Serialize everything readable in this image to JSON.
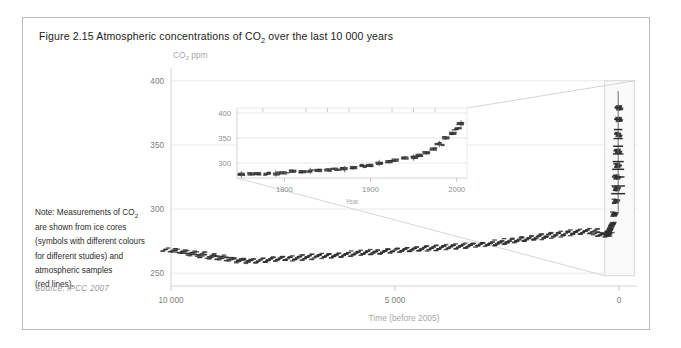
{
  "figure": {
    "title_prefix": "Figure 2.15 Atmospheric concentrations of CO",
    "title_sub": "2",
    "title_suffix": " over the last 10 000 years",
    "note_line1_a": "Note: Measurements of CO",
    "note_line1_sub": "2",
    "note_line2": "are shown from ice cores",
    "note_line3": "(symbols with different colours",
    "note_line4": "for different studies) and",
    "note_line5": "atmospheric samples",
    "note_line6": "(red lines).",
    "source": "Source: IPCC 2007",
    "border_color": "#b9b9b9"
  },
  "chart_data": {
    "type": "scatter",
    "title": "Figure 2.15 Atmospheric concentrations of CO2 over the last 10 000 years",
    "xlabel": "Time (before 2005)",
    "ylabel": "CO2 ppm",
    "xlim": [
      10000,
      -400
    ],
    "ylim": [
      240,
      410
    ],
    "x_ticks": [
      10000,
      5000,
      0
    ],
    "x_tick_labels": [
      "10 000",
      "5 000",
      "0"
    ],
    "y_ticks": [
      250,
      300,
      350,
      400
    ],
    "y_tick_labels": [
      "250",
      "300",
      "350",
      "400"
    ],
    "grid": true,
    "legend": "none",
    "series": [
      {
        "name": "Ice core and atmospheric CO2",
        "color": "#2e2e2e",
        "x": [
          10000,
          9800,
          9600,
          9400,
          9200,
          9000,
          8800,
          8600,
          8400,
          8200,
          8000,
          7800,
          7600,
          7400,
          7200,
          7000,
          6800,
          6600,
          6400,
          6200,
          6000,
          5800,
          5600,
          5400,
          5200,
          5000,
          4800,
          4600,
          4400,
          4200,
          4000,
          3800,
          3600,
          3400,
          3200,
          3000,
          2800,
          2600,
          2400,
          2200,
          2000,
          1800,
          1600,
          1400,
          1200,
          1000,
          800,
          600,
          400,
          300,
          250,
          205,
          155,
          105,
          75,
          55,
          45,
          35,
          25,
          15,
          8,
          2
        ],
        "y": [
          268,
          267,
          266,
          265,
          263.5,
          262.5,
          261.5,
          260.5,
          260,
          259.5,
          260,
          260.5,
          261,
          261.5,
          262,
          262.5,
          263,
          263.5,
          264,
          264.5,
          265,
          265.5,
          266,
          266.5,
          267,
          267.5,
          268,
          268.5,
          269,
          269.5,
          270,
          270.5,
          271,
          271.5,
          272,
          272.5,
          273,
          274,
          275,
          276,
          277,
          278,
          279,
          280,
          281,
          282,
          282.5,
          283,
          281,
          280,
          280.5,
          284,
          288,
          296,
          306,
          316,
          325,
          334,
          345,
          358,
          370,
          379
        ],
        "error_x": 60
      }
    ],
    "inset": {
      "type": "scatter",
      "xlabel": "Year",
      "xlim": [
        1745,
        2012
      ],
      "ylim": [
        270,
        410
      ],
      "x_ticks": [
        1800,
        1900,
        2000
      ],
      "x_tick_labels": [
        "1800",
        "1900",
        "2000"
      ],
      "y_ticks": [
        300,
        350,
        400
      ],
      "y_tick_labels": [
        "300",
        "350",
        "400"
      ],
      "series": [
        {
          "name": "Ice core and atmospheric CO2 (recent)",
          "color": "#2e2e2e",
          "x": [
            1750,
            1760,
            1770,
            1780,
            1790,
            1800,
            1810,
            1820,
            1830,
            1840,
            1850,
            1860,
            1870,
            1880,
            1890,
            1900,
            1910,
            1920,
            1930,
            1940,
            1950,
            1958,
            1965,
            1972,
            1980,
            1988,
            1995,
            2000,
            2005
          ],
          "y": [
            277,
            277.5,
            278,
            278.5,
            279,
            281,
            284,
            283,
            284,
            285,
            286,
            287,
            288,
            290,
            294,
            296,
            300,
            303,
            306,
            310,
            311,
            315,
            320,
            327,
            338,
            351,
            360,
            369,
            379
          ],
          "error_y": 3
        }
      ]
    },
    "annotations": [
      {
        "type": "highlight-box",
        "note": "box around modern rise in main plot"
      },
      {
        "type": "leader-lines",
        "note": "connectors from inset corners to highlight box"
      }
    ]
  }
}
